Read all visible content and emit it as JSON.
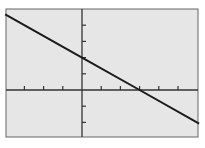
{
  "chart_data": {
    "type": "line",
    "title": "",
    "xlabel": "",
    "ylabel": "",
    "equation": "y = -2/3 x + 2",
    "xlim": [
      -4,
      6
    ],
    "ylim": [
      -3,
      5
    ],
    "x_ticks": [
      -3,
      -2,
      -1,
      1,
      2,
      3,
      4,
      5
    ],
    "y_ticks": [
      -2,
      -1,
      1,
      2,
      3,
      4
    ],
    "grid": false,
    "series": [
      {
        "name": "line",
        "x": [
          -4,
          0,
          3,
          6.1
        ],
        "y": [
          4.67,
          2,
          0,
          -2.07
        ]
      }
    ],
    "y_intercept": 2,
    "x_intercept": 3
  },
  "colors": {
    "background": "#e6e6e6",
    "axis": "#333333",
    "line": "#1a1a1a",
    "frame": "#555555"
  }
}
